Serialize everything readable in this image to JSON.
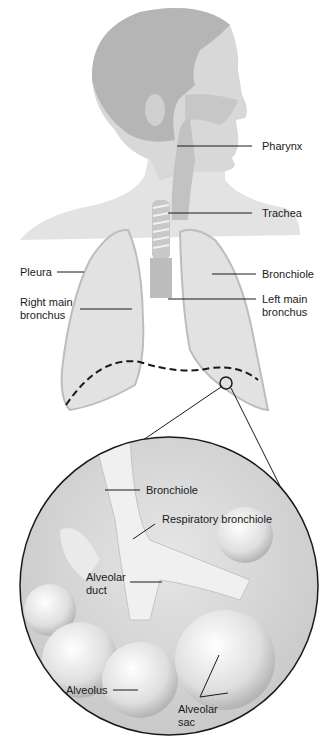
{
  "diagram": {
    "upper_labels": {
      "pharynx": "Pharynx",
      "trachea": "Trachea",
      "pleura": "Pleura",
      "bronchiole": "Bronchiole",
      "right_main_bronchus_1": "Right main",
      "right_main_bronchus_2": "bronchus",
      "left_main_bronchus_1": "Left main",
      "left_main_bronchus_2": "bronchus"
    },
    "inset_labels": {
      "bronchiole": "Bronchiole",
      "respiratory_bronchiole": "Respiratory bronchiole",
      "alveolar_duct_1": "Alveolar",
      "alveolar_duct_2": "duct",
      "alveolus": "Alveolus",
      "alveolar_sac_1": "Alveolar",
      "alveolar_sac_2": "sac"
    },
    "colors": {
      "head": "#b9b9b9",
      "skin": "#dcdcdc",
      "lung": "#e2e2e2",
      "line": "#1a1a1a"
    }
  }
}
